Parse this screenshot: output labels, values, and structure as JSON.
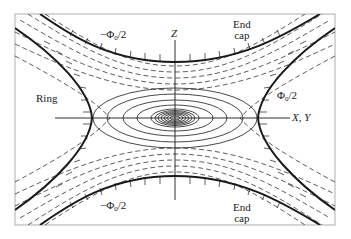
{
  "diagram": {
    "type": "Paul ion trap electrode and equipotential field diagram",
    "axes": {
      "vertical_label": "Z",
      "horizontal_label": "X, Y"
    },
    "electrodes": {
      "ring_label": "Ring",
      "endcap_top_label_line1": "End",
      "endcap_top_label_line2": "cap",
      "endcap_bottom_label_line1": "End",
      "endcap_bottom_label_line2": "cap"
    },
    "potentials": {
      "top": "−Φ",
      "top_sub": "0",
      "top_tail": "/2",
      "right": "Φ",
      "right_sub": "0",
      "right_tail": "/2",
      "bottom": "−Φ",
      "bottom_sub": "0",
      "bottom_tail": "/2"
    },
    "colors": {
      "line": "#1a1a1a",
      "background": "#ffffff"
    }
  }
}
